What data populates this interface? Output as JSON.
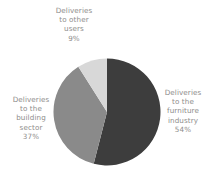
{
  "chart_data": {
    "type": "pie",
    "title": "",
    "categories": [
      "Deliveries to the furniture industry",
      "Deliveries to the building sector",
      "Deliveries to other users"
    ],
    "values": [
      54,
      37,
      9
    ],
    "value_unit": "%",
    "colors": [
      "#3d3d3d",
      "#8a8a8a",
      "#d8d8d8"
    ],
    "background": "#ffffff",
    "label_color": "#8e8d8b",
    "legend": "none",
    "grid": false,
    "labels_position": "outside",
    "slices": [
      {
        "name": "furniture",
        "color": "#3d3d3d",
        "percent": 54,
        "percent_text": "54%",
        "lines": [
          "Deliveries",
          "to the",
          "furniture",
          "industry",
          "54%"
        ]
      },
      {
        "name": "building",
        "color": "#8a8a8a",
        "percent": 37,
        "percent_text": "37%",
        "lines": [
          "Deliveries",
          "to the",
          "building",
          "sector",
          "37%"
        ]
      },
      {
        "name": "other",
        "color": "#d8d8d8",
        "percent": 9,
        "percent_text": "9%",
        "lines": [
          "Deliveries",
          "to other",
          "users",
          "9%"
        ]
      }
    ]
  }
}
